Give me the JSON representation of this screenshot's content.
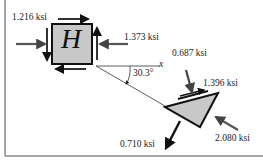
{
  "figure": {
    "element_label": "H",
    "axis_label": "x",
    "angle_label": "30.3°",
    "stresses_element_H": {
      "sigma_x": "1.216 ksi",
      "sigma_x_label_position": "upper-left",
      "right_face": "1.373 ksi"
    },
    "stresses_rotated_element": {
      "normal_top": "0.687 ksi",
      "shear": "1.396 ksi",
      "normal_right": "2.080 ksi",
      "normal_bottom": "0.710 ksi"
    },
    "colors": {
      "element_fill": "#c8c8c8",
      "outline": "#111111",
      "arrow": "#555555",
      "frame": "#888888"
    }
  }
}
